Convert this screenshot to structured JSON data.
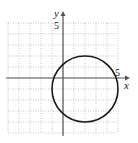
{
  "chart_data": {
    "type": "line",
    "title": "",
    "xlabel": "x",
    "ylabel": "y",
    "xlim": [
      -5,
      5
    ],
    "ylim": [
      -5,
      5
    ],
    "grid": true,
    "tick_labels": {
      "x": "5",
      "y": "5"
    },
    "series": [
      {
        "name": "circle",
        "shape": "circle",
        "center": [
          2,
          -1
        ],
        "radius": 3,
        "equation": "(x - 2)^2 + (y + 1)^2 = 9"
      }
    ]
  },
  "colors": {
    "grid": "#b8b8b8",
    "axis": "#555555",
    "curve": "#1a1a1a"
  }
}
